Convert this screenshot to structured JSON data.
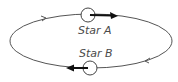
{
  "diagram": {
    "type": "binary-star-orbit",
    "colors": {
      "orbit": "#555555",
      "arrow": "#111111",
      "label": "#4a4a4a",
      "background": "#ffffff"
    },
    "stars": [
      {
        "id": "A",
        "label": "Star A",
        "position": "top",
        "velocity_direction": "right"
      },
      {
        "id": "B",
        "label": "Star B",
        "position": "bottom",
        "velocity_direction": "left"
      }
    ],
    "orbit_direction": "clockwise",
    "orbit_arrow_icons": [
      "chevron-right-icon",
      "chevron-left-icon"
    ]
  }
}
